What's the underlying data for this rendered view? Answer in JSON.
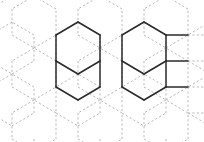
{
  "figure": {
    "kind": "hexagonal-lattice-diagram",
    "width": 204,
    "height": 142,
    "background_color": "#ffffff"
  },
  "style": {
    "dashed_edge_color": "#b9b9b9",
    "dashed_edge_width": 1,
    "dashed_pattern": "2.2 2.2",
    "solid_edge_color": "#2a2a2a",
    "solid_edge_width": 1.5
  },
  "geometry": {
    "hex_orientation": "pointy-top",
    "hex_width": 44,
    "hex_height": 52,
    "column_step_x": 33,
    "row_step_y": 26,
    "origin_x": 12,
    "origin_y": -4,
    "columns": 6,
    "rows": 7
  },
  "dashed_edges": [
    [
      12,
      9,
      12,
      35
    ],
    [
      12,
      35,
      34,
      48
    ],
    [
      34,
      48,
      56,
      35
    ],
    [
      56,
      35,
      56,
      9
    ],
    [
      56,
      9,
      34,
      -4
    ],
    [
      34,
      -4,
      12,
      9
    ],
    [
      78,
      9,
      78,
      35
    ],
    [
      78,
      35,
      100,
      48
    ],
    [
      100,
      48,
      122,
      35
    ],
    [
      122,
      35,
      122,
      9
    ],
    [
      122,
      9,
      100,
      -4
    ],
    [
      100,
      -4,
      78,
      9
    ],
    [
      144,
      9,
      144,
      35
    ],
    [
      144,
      35,
      166,
      48
    ],
    [
      166,
      48,
      188,
      35
    ],
    [
      188,
      35,
      188,
      9
    ],
    [
      188,
      9,
      166,
      -4
    ],
    [
      166,
      -4,
      144,
      9
    ],
    [
      -10,
      35,
      -10,
      61
    ],
    [
      -10,
      61,
      12,
      74
    ],
    [
      12,
      74,
      34,
      61
    ],
    [
      34,
      61,
      34,
      35
    ],
    [
      34,
      35,
      12,
      22
    ],
    [
      12,
      22,
      -10,
      35
    ],
    [
      56,
      35,
      56,
      61
    ],
    [
      56,
      61,
      78,
      74
    ],
    [
      78,
      74,
      100,
      61
    ],
    [
      100,
      61,
      100,
      35
    ],
    [
      100,
      35,
      78,
      22
    ],
    [
      78,
      22,
      56,
      35
    ],
    [
      122,
      35,
      122,
      61
    ],
    [
      122,
      61,
      144,
      74
    ],
    [
      144,
      74,
      166,
      61
    ],
    [
      166,
      61,
      166,
      35
    ],
    [
      166,
      35,
      144,
      22
    ],
    [
      144,
      22,
      122,
      35
    ],
    [
      188,
      35,
      188,
      61
    ],
    [
      188,
      61,
      210,
      74
    ],
    [
      210,
      74,
      232,
      61
    ],
    [
      232,
      61,
      232,
      35
    ],
    [
      232,
      35,
      210,
      22
    ],
    [
      210,
      22,
      188,
      35
    ],
    [
      12,
      61,
      12,
      87
    ],
    [
      12,
      87,
      34,
      100
    ],
    [
      34,
      100,
      56,
      87
    ],
    [
      56,
      87,
      56,
      61
    ],
    [
      56,
      61,
      34,
      48
    ],
    [
      34,
      48,
      12,
      61
    ],
    [
      78,
      61,
      78,
      87
    ],
    [
      78,
      87,
      100,
      100
    ],
    [
      100,
      100,
      122,
      87
    ],
    [
      122,
      87,
      122,
      61
    ],
    [
      122,
      61,
      100,
      48
    ],
    [
      100,
      48,
      78,
      61
    ],
    [
      144,
      61,
      144,
      87
    ],
    [
      144,
      87,
      166,
      100
    ],
    [
      166,
      100,
      188,
      87
    ],
    [
      188,
      87,
      188,
      61
    ],
    [
      188,
      61,
      166,
      48
    ],
    [
      166,
      48,
      144,
      61
    ],
    [
      -10,
      87,
      -10,
      113
    ],
    [
      -10,
      113,
      12,
      126
    ],
    [
      12,
      126,
      34,
      113
    ],
    [
      34,
      113,
      34,
      87
    ],
    [
      34,
      87,
      12,
      74
    ],
    [
      12,
      74,
      -10,
      87
    ],
    [
      56,
      87,
      56,
      113
    ],
    [
      56,
      113,
      78,
      126
    ],
    [
      78,
      126,
      100,
      113
    ],
    [
      100,
      113,
      100,
      87
    ],
    [
      100,
      87,
      78,
      74
    ],
    [
      78,
      74,
      56,
      87
    ],
    [
      122,
      87,
      122,
      113
    ],
    [
      122,
      113,
      144,
      126
    ],
    [
      144,
      126,
      166,
      113
    ],
    [
      166,
      113,
      166,
      87
    ],
    [
      166,
      87,
      144,
      74
    ],
    [
      144,
      74,
      122,
      87
    ],
    [
      188,
      87,
      188,
      113
    ],
    [
      188,
      113,
      210,
      126
    ],
    [
      210,
      126,
      232,
      113
    ],
    [
      232,
      113,
      232,
      87
    ],
    [
      232,
      87,
      210,
      74
    ],
    [
      210,
      74,
      188,
      87
    ],
    [
      12,
      113,
      12,
      139
    ],
    [
      12,
      139,
      34,
      152
    ],
    [
      34,
      152,
      56,
      139
    ],
    [
      56,
      139,
      56,
      113
    ],
    [
      56,
      113,
      34,
      100
    ],
    [
      34,
      100,
      12,
      113
    ],
    [
      78,
      113,
      78,
      139
    ],
    [
      78,
      139,
      100,
      152
    ],
    [
      100,
      152,
      122,
      139
    ],
    [
      122,
      139,
      122,
      113
    ],
    [
      122,
      113,
      100,
      100
    ],
    [
      100,
      100,
      78,
      113
    ],
    [
      144,
      113,
      144,
      139
    ],
    [
      144,
      139,
      166,
      152
    ],
    [
      166,
      152,
      188,
      139
    ],
    [
      188,
      139,
      188,
      113
    ],
    [
      188,
      113,
      166,
      100
    ],
    [
      166,
      100,
      144,
      113
    ],
    [
      -10,
      139,
      -10,
      165
    ],
    [
      34,
      139,
      34,
      165
    ],
    [
      100,
      139,
      100,
      165
    ],
    [
      166,
      139,
      166,
      165
    ],
    [
      188,
      35,
      210,
      35
    ],
    [
      188,
      61,
      210,
      61
    ],
    [
      188,
      87,
      210,
      87
    ],
    [
      188,
      113,
      210,
      113
    ],
    [
      -10,
      9,
      -10,
      35
    ],
    [
      -10,
      9,
      12,
      -4
    ]
  ],
  "solid_edges": [
    [
      56,
      35,
      56,
      61
    ],
    [
      56,
      35,
      78,
      22
    ],
    [
      78,
      22,
      100,
      35
    ],
    [
      100,
      35,
      100,
      61
    ],
    [
      100,
      61,
      78,
      74
    ],
    [
      78,
      74,
      56,
      61
    ],
    [
      56,
      61,
      56,
      87
    ],
    [
      56,
      87,
      78,
      100
    ],
    [
      78,
      100,
      100,
      87
    ],
    [
      100,
      87,
      100,
      61
    ],
    [
      122,
      35,
      122,
      61
    ],
    [
      122,
      35,
      144,
      22
    ],
    [
      144,
      22,
      166,
      35
    ],
    [
      166,
      35,
      188,
      35
    ],
    [
      166,
      35,
      166,
      61
    ],
    [
      166,
      61,
      188,
      61
    ],
    [
      166,
      61,
      144,
      74
    ],
    [
      144,
      74,
      122,
      61
    ],
    [
      122,
      61,
      122,
      87
    ],
    [
      122,
      87,
      144,
      100
    ],
    [
      144,
      100,
      166,
      87
    ],
    [
      166,
      87,
      188,
      87
    ],
    [
      166,
      87,
      166,
      61
    ]
  ],
  "highlighted_clusters": [
    {
      "name": "left-cluster",
      "hex_count": 2,
      "description": "Vertical pair of fully outlined hexagons left of center"
    },
    {
      "name": "right-cluster",
      "hex_count": 3,
      "description": "Branching group of outlined hexagons right of center with horizontal stubs"
    }
  ]
}
